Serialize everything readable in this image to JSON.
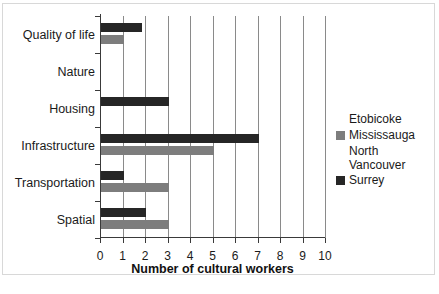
{
  "chart_data": {
    "type": "bar",
    "orientation": "horizontal",
    "title": "",
    "xlabel": "Number of cultural workers",
    "ylabel": "",
    "xlim": [
      0,
      10
    ],
    "xticks": [
      0,
      1,
      2,
      3,
      4,
      5,
      6,
      7,
      8,
      9,
      10
    ],
    "grid": "vertical",
    "legend_position": "right",
    "categories": [
      "Quality of life",
      "Nature",
      "Housing",
      "Infrastructure",
      "Transportation",
      "Spatial"
    ],
    "series": [
      {
        "name": "Etobicoke",
        "color": "#ffffff",
        "values": [
          0,
          0,
          0,
          0,
          0,
          0
        ]
      },
      {
        "name": "Mississauga",
        "color": "#7d7d7d",
        "values": [
          1,
          0,
          0,
          5,
          3,
          3
        ]
      },
      {
        "name": "North\nVancouver",
        "color": "#ffffff",
        "values": [
          0,
          0,
          0,
          0,
          0,
          0
        ]
      },
      {
        "name": "Surrey",
        "color": "#262626",
        "values": [
          1.8,
          0,
          3,
          7,
          1,
          2
        ]
      }
    ]
  },
  "legend": {
    "entries": [
      {
        "label": "Etobicoke",
        "color": "#ffffff",
        "has_swatch": false
      },
      {
        "label": "Mississauga",
        "color": "#7d7d7d",
        "has_swatch": true
      },
      {
        "label": "North\nVancouver",
        "color": "#ffffff",
        "has_swatch": false
      },
      {
        "label": "Surrey",
        "color": "#262626",
        "has_swatch": true
      }
    ]
  },
  "axis": {
    "x_title": "Number of cultural workers",
    "tick_labels": [
      "0",
      "1",
      "2",
      "3",
      "4",
      "5",
      "6",
      "7",
      "8",
      "9",
      "10"
    ]
  }
}
